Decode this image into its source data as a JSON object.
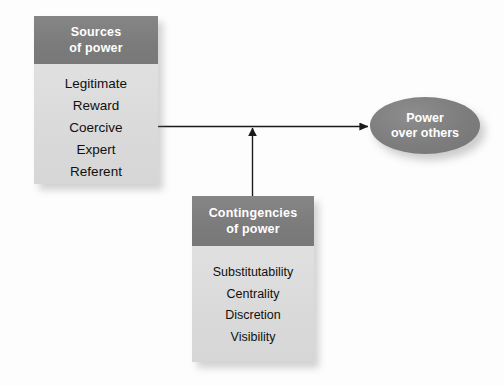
{
  "diagram": {
    "type": "flow-diagram",
    "background_color": "#fdfdfd",
    "accent_header_color": "#7f7f7f",
    "body_fill_color": "#dcdcdc",
    "ellipse_color": "#7c7c7c",
    "connector_color": "#1a1a1a",
    "nodes": {
      "sources": {
        "header_line1": "Sources",
        "header_line2": "of power",
        "items": [
          "Legitimate",
          "Reward",
          "Coercive",
          "Expert",
          "Referent"
        ]
      },
      "contingencies": {
        "header_line1": "Contingencies",
        "header_line2": "of power",
        "items": [
          "Substitutability",
          "Centrality",
          "Discretion",
          "Visibility"
        ]
      },
      "outcome": {
        "line1": "Power",
        "line2": "over others"
      }
    },
    "connectors": [
      {
        "name": "sources-to-outcome",
        "from": "sources",
        "to": "outcome",
        "orientation": "horizontal",
        "arrowhead": "end"
      },
      {
        "name": "contingencies-to-link",
        "from": "contingencies",
        "to": "sources-to-outcome",
        "orientation": "vertical",
        "arrowhead": "end"
      }
    ]
  }
}
